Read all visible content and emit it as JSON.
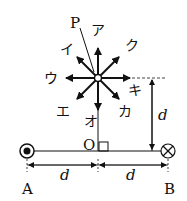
{
  "point_label": "P",
  "origin_label": "O",
  "wire_a": {
    "label": "A",
    "current": "out-of-page"
  },
  "wire_b": {
    "label": "B",
    "current": "into-page"
  },
  "distance_label": "d",
  "arrows": [
    {
      "label": "ア",
      "direction": "up"
    },
    {
      "label": "イ",
      "direction": "up-left"
    },
    {
      "label": "ウ",
      "direction": "left"
    },
    {
      "label": "エ",
      "direction": "down-left"
    },
    {
      "label": "オ",
      "direction": "down"
    },
    {
      "label": "カ",
      "direction": "down-right"
    },
    {
      "label": "キ",
      "direction": "right"
    },
    {
      "label": "ク",
      "direction": "up-right"
    }
  ],
  "colors": {
    "ink": "#111111",
    "background": "#ffffff"
  }
}
